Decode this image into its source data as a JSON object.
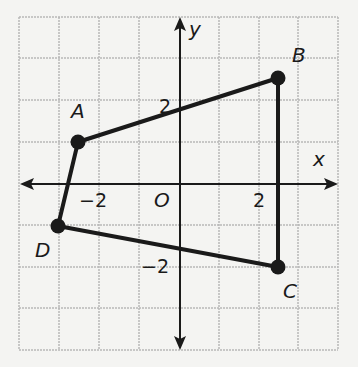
{
  "figure": {
    "type": "coordinate-plane-polygon",
    "axes": {
      "x_label": "x",
      "y_label": "y",
      "origin_label": "O"
    },
    "tick_labels": {
      "x_neg": "−2",
      "x_pos": "2",
      "y_pos": "2",
      "y_neg": "−2"
    },
    "grid": {
      "xmin": -4,
      "xmax": 4,
      "ymin": -4,
      "ymax": 4,
      "step": 1
    },
    "points": [
      {
        "name": "A",
        "x": -2.5,
        "y": 1
      },
      {
        "name": "B",
        "x": 2.5,
        "y": 2.5
      },
      {
        "name": "C",
        "x": 2.5,
        "y": -2
      },
      {
        "name": "D",
        "x": -3,
        "y": -1
      }
    ],
    "polygon_order": [
      "A",
      "B",
      "C",
      "D"
    ],
    "colors": {
      "grid": "#b8b8b8",
      "lines": "#1a1a1a",
      "background": "#f4f4f2"
    }
  }
}
